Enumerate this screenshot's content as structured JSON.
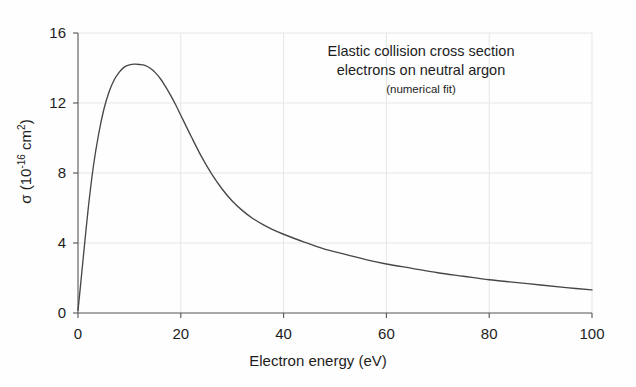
{
  "chart_data": {
    "type": "line",
    "title": "",
    "annotation": {
      "line1": "Elastic collision cross section",
      "line2": "electrons on neutral argon",
      "line3": "(numerical fit)"
    },
    "xlabel": "Electron energy (eV)",
    "ylabel_sigma": "σ (10",
    "ylabel_exp": "-16",
    "ylabel_tail": " cm",
    "ylabel_exp2": "2",
    "ylabel_close": ")",
    "ylabel_full": "σ (10^-16 cm^2)",
    "xlim": [
      0,
      100
    ],
    "ylim": [
      0,
      16
    ],
    "xticks": [
      0,
      20,
      40,
      60,
      80,
      100
    ],
    "yticks": [
      0,
      4,
      8,
      12,
      16
    ],
    "xtick_labels": [
      "0",
      "20",
      "40",
      "60",
      "80",
      "100"
    ],
    "ytick_labels": [
      "0",
      "4",
      "8",
      "12",
      "16"
    ],
    "grid": true,
    "legend": "none",
    "line_color": "#474747",
    "grid_color": "#e6e6e6",
    "axis_color": "#555555",
    "background": "#ffffff",
    "series": [
      {
        "name": "Elastic cross section (numerical fit)",
        "x": [
          0,
          0.5,
          1,
          2,
          3,
          4,
          5,
          6,
          7,
          8,
          9,
          10,
          11,
          12,
          13,
          14,
          15,
          16,
          17,
          18,
          19,
          20,
          22,
          24,
          26,
          28,
          30,
          32,
          34,
          36,
          38,
          40,
          44,
          48,
          52,
          56,
          60,
          65,
          70,
          75,
          80,
          85,
          90,
          95,
          100
        ],
        "y": [
          0.15,
          1.6,
          3.1,
          6.0,
          8.4,
          10.2,
          11.6,
          12.6,
          13.3,
          13.75,
          14.05,
          14.18,
          14.22,
          14.2,
          14.15,
          14.0,
          13.75,
          13.4,
          12.95,
          12.45,
          11.9,
          11.3,
          10.1,
          8.95,
          7.95,
          7.1,
          6.4,
          5.85,
          5.4,
          5.05,
          4.75,
          4.5,
          4.05,
          3.65,
          3.35,
          3.05,
          2.8,
          2.55,
          2.3,
          2.1,
          1.9,
          1.75,
          1.6,
          1.45,
          1.32
        ]
      }
    ],
    "peak": {
      "x": 11.5,
      "y": 14.22
    }
  }
}
